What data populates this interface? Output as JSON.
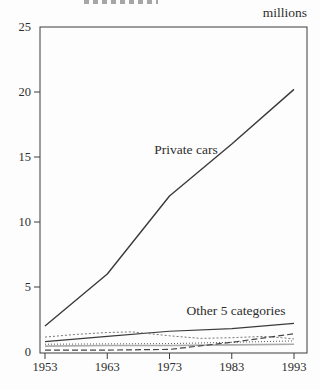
{
  "chart": {
    "unit_label": "millions",
    "annotations": {
      "private_cars": "Private cars",
      "other_categories": "Other 5 categories"
    }
  },
  "chart_data": {
    "type": "line",
    "title": "",
    "xlabel": "",
    "ylabel": "millions",
    "xlim": [
      1953,
      1993
    ],
    "ylim": [
      0,
      25
    ],
    "x_ticks": [
      1953,
      1963,
      1973,
      1983,
      1993
    ],
    "y_ticks": [
      0,
      5,
      10,
      15,
      20,
      25
    ],
    "grid": false,
    "legend": "in-chart text annotations",
    "series": [
      {
        "name": "Private cars",
        "line_style": "solid",
        "color": "#3a3a3a",
        "width": 1.4,
        "x": [
          1953,
          1963,
          1973,
          1983,
          1993
        ],
        "values": [
          2.0,
          6.0,
          12.0,
          16.0,
          20.2
        ]
      },
      {
        "name": "Other category (solid line)",
        "line_style": "solid",
        "color": "#3a3a3a",
        "width": 1.1,
        "x": [
          1953,
          1963,
          1973,
          1983,
          1993
        ],
        "values": [
          0.8,
          1.2,
          1.6,
          1.8,
          2.2
        ]
      },
      {
        "name": "Other category (sparse dotted line)",
        "line_style": "dotted",
        "dash": "2,2",
        "color": "#777777",
        "width": 1,
        "x": [
          1953,
          1958,
          1963,
          1967,
          1973,
          1978,
          1983,
          1988,
          1991,
          1993
        ],
        "values": [
          1.15,
          1.35,
          1.5,
          1.55,
          1.25,
          1.05,
          1.1,
          1.2,
          1.1,
          1.0
        ]
      },
      {
        "name": "Other category (fine dotted line)",
        "line_style": "dotted",
        "dash": "1,2",
        "color": "#555555",
        "width": 1,
        "x": [
          1953,
          1963,
          1973,
          1983,
          1993
        ],
        "values": [
          0.6,
          0.62,
          0.65,
          0.75,
          0.85
        ]
      },
      {
        "name": "Other category (gray line)",
        "line_style": "solid",
        "color": "#aaaaaa",
        "width": 1.6,
        "x": [
          1953,
          1963,
          1973,
          1983,
          1993
        ],
        "values": [
          0.45,
          0.5,
          0.5,
          0.55,
          0.6
        ]
      },
      {
        "name": "Other category (dashed line)",
        "line_style": "dashed",
        "dash": "6,3",
        "color": "#444444",
        "width": 1.2,
        "x": [
          1953,
          1963,
          1973,
          1983,
          1993
        ],
        "values": [
          0.15,
          0.15,
          0.2,
          0.75,
          1.4
        ]
      }
    ]
  }
}
